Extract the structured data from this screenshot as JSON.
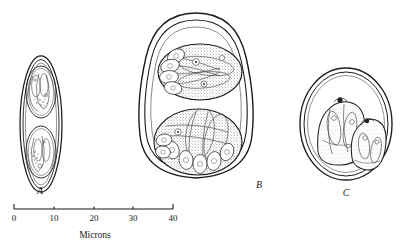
{
  "plate": {
    "title": "Coccidian oocysts comparative plate",
    "background_color": "#ffffff",
    "ink_color": "#1b1b1b"
  },
  "figures": [
    {
      "id": "A",
      "label": "A",
      "label_x": 40,
      "label_y": 194,
      "shape": "narrow-ellipse",
      "description": "Slender elongate oocyst with double wall enclosing two sporocysts",
      "sporocyst_count": 2,
      "cx": 41,
      "cy": 124,
      "rx": 21,
      "ry": 68
    },
    {
      "id": "B",
      "label": "B",
      "label_x": 259,
      "label_y": 188,
      "shape": "ovoid-egg",
      "description": "Large ovoid oocyst with thick triple wall and two granular sporocysts packed with sporozoites",
      "sporocyst_count": 2,
      "cx": 196,
      "cy": 106,
      "rx": 58,
      "ry": 93
    },
    {
      "id": "C",
      "label": "C",
      "label_x": 346,
      "label_y": 196,
      "shape": "subspherical",
      "description": "Subspherical oocyst with double wall and two overlapping stippled sporocysts",
      "sporocyst_count": 2,
      "cx": 346,
      "cy": 124,
      "rx": 46,
      "ry": 56
    }
  ],
  "scale": {
    "axis_title": "Microns",
    "axis_title_x": 95,
    "axis_title_y": 238,
    "unit": "microns",
    "min": 0,
    "max": 40,
    "x_start": 14,
    "x_end": 173,
    "y": 209,
    "ticks": [
      {
        "value": "0",
        "x": 14,
        "major": true
      },
      {
        "value": "10",
        "x": 54,
        "major": false
      },
      {
        "value": "20",
        "x": 94,
        "major": false
      },
      {
        "value": "30",
        "x": 133,
        "major": false
      },
      {
        "value": "40",
        "x": 173,
        "major": true
      }
    ],
    "tick_label_y": 221
  }
}
